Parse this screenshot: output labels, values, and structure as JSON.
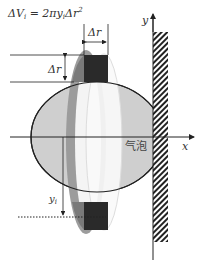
{
  "formula": {
    "delta_v": "ΔV",
    "sub_i": "i",
    "eq": " = 2π",
    "y": "y",
    "sub_i2": "i",
    "tail": "Δr",
    "sup": "2"
  },
  "labels": {
    "delta_r_top": "Δr",
    "delta_r_side": "Δr",
    "y_axis": "y",
    "x_axis": "x",
    "bubble": "气泡",
    "y_i": "y",
    "y_i_sub": "i"
  },
  "colors": {
    "bubble_fill": "#cfcfcf",
    "ring_dark": "#8a8a8a",
    "block_dark": "#2a2a2a",
    "line": "#222222",
    "inner_light": "#f2f2f2"
  }
}
